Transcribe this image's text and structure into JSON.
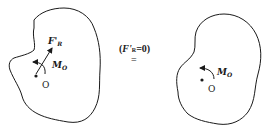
{
  "left_body": {
    "force_label": "F'",
    "force_sub": "R",
    "moment_label": "M",
    "moment_sub": "O",
    "point_label": "O"
  },
  "condition": {
    "open": "(",
    "force": "F'",
    "force_sub": "R",
    "rest": "=0",
    "close": ")",
    "equals": "="
  },
  "right_body": {
    "moment_label": "M",
    "moment_sub": "O",
    "point_label": "O"
  },
  "colors": {
    "ink": "#1a1a1a",
    "background": "#ffffff"
  }
}
